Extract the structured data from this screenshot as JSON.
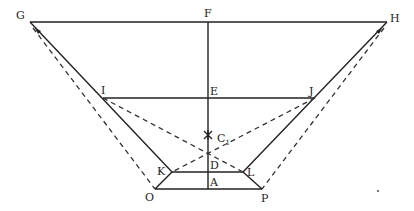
{
  "diagram": {
    "type": "geometric-construction",
    "points": {
      "G": [
        30,
        22
      ],
      "F": [
        208,
        22
      ],
      "H": [
        387,
        22
      ],
      "I": [
        103,
        98
      ],
      "E": [
        208,
        98
      ],
      "J": [
        315,
        98
      ],
      "C1": [
        208,
        135
      ],
      "K": [
        172,
        172
      ],
      "D": [
        208,
        172
      ],
      "L": [
        243,
        172
      ],
      "O": [
        155,
        189
      ],
      "A": [
        208,
        189
      ],
      "P": [
        262,
        189
      ]
    },
    "labels": {
      "G": "G",
      "F": "F",
      "H": "H",
      "I": "I",
      "E": "E",
      "J": "J",
      "C": "C",
      "C_sub": "1",
      "K": "K",
      "D": "D",
      "L": "L",
      "O": "O",
      "A": "A",
      "P": "P"
    },
    "solid_lines": [
      [
        "G",
        "H"
      ],
      [
        "I",
        "J"
      ],
      [
        "K",
        "L"
      ],
      [
        "O",
        "P"
      ],
      [
        "F",
        "A"
      ],
      [
        "G",
        "K"
      ],
      [
        "H",
        "L"
      ],
      [
        "K",
        "O"
      ],
      [
        "L",
        "P"
      ]
    ],
    "dashed_lines": [
      [
        "G",
        "O"
      ],
      [
        "H",
        "P"
      ],
      [
        "I",
        "L"
      ],
      [
        "J",
        "K"
      ]
    ]
  }
}
